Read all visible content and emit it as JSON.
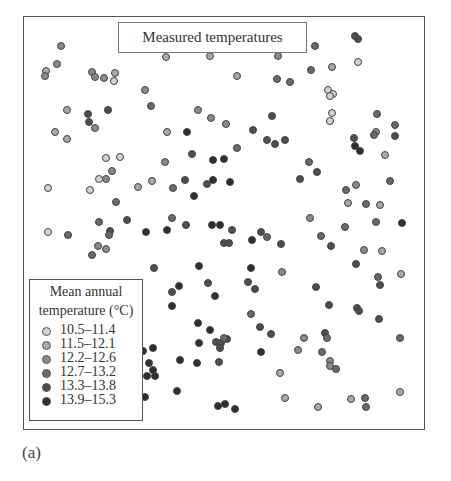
{
  "title": "Measured temperatures",
  "panel_label": "(a)",
  "legend": {
    "title_line1": "Mean annual",
    "title_line2": "temperature (°C)",
    "items": [
      {
        "label": "10.5–11.4",
        "color": "#d2d2d2"
      },
      {
        "label": "11.5–12.1",
        "color": "#a8a8a8"
      },
      {
        "label": "12.2–12.6",
        "color": "#8a8a8a"
      },
      {
        "label": "12.7–13.2",
        "color": "#6a6a6a"
      },
      {
        "label": "13.3–13.8",
        "color": "#4e4e4e"
      },
      {
        "label": "13.9–15.3",
        "color": "#2e2e2e"
      }
    ]
  },
  "chart_data": {
    "type": "scatter",
    "title": "Measured temperatures",
    "xlabel": "",
    "ylabel": "",
    "legend_position": "bottom-left",
    "grid": false,
    "class_labels": [
      "10.5–11.4",
      "11.5–12.1",
      "12.2–12.6",
      "12.7–13.2",
      "13.3–13.8",
      "13.9–15.3"
    ],
    "points_px": [
      [
        61,
        46,
        3
      ],
      [
        57,
        64,
        3
      ],
      [
        46,
        71,
        2
      ],
      [
        45,
        76,
        3
      ],
      [
        92,
        72,
        3
      ],
      [
        95,
        77,
        3
      ],
      [
        104,
        78,
        3
      ],
      [
        115,
        73,
        2
      ],
      [
        114,
        81,
        1
      ],
      [
        166,
        57,
        2
      ],
      [
        210,
        56,
        2
      ],
      [
        278,
        56,
        3
      ],
      [
        315,
        46,
        4
      ],
      [
        311,
        70,
        4
      ],
      [
        332,
        67,
        2
      ],
      [
        358,
        39,
        5
      ],
      [
        355,
        36,
        5
      ],
      [
        358,
        62,
        1
      ],
      [
        237,
        76,
        2
      ],
      [
        277,
        79,
        4
      ],
      [
        290,
        82,
        4
      ],
      [
        145,
        90,
        3
      ],
      [
        151,
        106,
        4
      ],
      [
        67,
        110,
        2
      ],
      [
        88,
        114,
        5
      ],
      [
        89,
        122,
        5
      ],
      [
        95,
        128,
        3
      ],
      [
        108,
        110,
        5
      ],
      [
        55,
        132,
        2
      ],
      [
        67,
        139,
        2
      ],
      [
        198,
        110,
        3
      ],
      [
        211,
        118,
        3
      ],
      [
        226,
        124,
        3
      ],
      [
        272,
        116,
        5
      ],
      [
        253,
        130,
        5
      ],
      [
        167,
        132,
        2
      ],
      [
        187,
        132,
        6
      ],
      [
        328,
        90,
        1
      ],
      [
        333,
        94,
        1
      ],
      [
        330,
        96,
        1
      ],
      [
        332,
        113,
        1
      ],
      [
        330,
        121,
        1
      ],
      [
        377,
        114,
        4
      ],
      [
        395,
        125,
        4
      ],
      [
        376,
        132,
        3
      ],
      [
        374,
        135,
        4
      ],
      [
        395,
        136,
        5
      ],
      [
        267,
        140,
        5
      ],
      [
        275,
        144,
        5
      ],
      [
        285,
        140,
        5
      ],
      [
        237,
        148,
        4
      ],
      [
        192,
        154,
        5
      ],
      [
        213,
        160,
        6
      ],
      [
        224,
        159,
        6
      ],
      [
        165,
        162,
        3
      ],
      [
        106,
        158,
        1
      ],
      [
        120,
        157,
        1
      ],
      [
        354,
        138,
        5
      ],
      [
        355,
        146,
        6
      ],
      [
        360,
        151,
        6
      ],
      [
        385,
        155,
        2
      ],
      [
        309,
        162,
        4
      ],
      [
        317,
        172,
        5
      ],
      [
        300,
        179,
        5
      ],
      [
        112,
        171,
        3
      ],
      [
        99,
        179,
        1
      ],
      [
        106,
        179,
        3
      ],
      [
        48,
        188,
        1
      ],
      [
        90,
        190,
        1
      ],
      [
        138,
        187,
        2
      ],
      [
        152,
        181,
        2
      ],
      [
        173,
        188,
        4
      ],
      [
        185,
        180,
        5
      ],
      [
        207,
        184,
        5
      ],
      [
        213,
        180,
        6
      ],
      [
        230,
        182,
        6
      ],
      [
        194,
        196,
        6
      ],
      [
        346,
        190,
        4
      ],
      [
        356,
        185,
        3
      ],
      [
        390,
        181,
        4
      ],
      [
        116,
        202,
        4
      ],
      [
        348,
        203,
        2
      ],
      [
        366,
        204,
        4
      ],
      [
        380,
        205,
        2
      ],
      [
        99,
        222,
        4
      ],
      [
        127,
        220,
        5
      ],
      [
        172,
        218,
        4
      ],
      [
        186,
        225,
        5
      ],
      [
        212,
        225,
        6
      ],
      [
        220,
        225,
        6
      ],
      [
        232,
        230,
        5
      ],
      [
        167,
        230,
        6
      ],
      [
        146,
        232,
        6
      ],
      [
        110,
        231,
        5
      ],
      [
        109,
        235,
        4
      ],
      [
        48,
        232,
        1
      ],
      [
        68,
        235,
        4
      ],
      [
        98,
        246,
        3
      ],
      [
        106,
        249,
        3
      ],
      [
        92,
        255,
        4
      ],
      [
        310,
        218,
        3
      ],
      [
        321,
        236,
        4
      ],
      [
        331,
        246,
        5
      ],
      [
        345,
        227,
        4
      ],
      [
        376,
        222,
        4
      ],
      [
        402,
        223,
        6
      ],
      [
        252,
        240,
        6
      ],
      [
        261,
        232,
        5
      ],
      [
        267,
        237,
        4
      ],
      [
        281,
        244,
        5
      ],
      [
        224,
        243,
        5
      ],
      [
        229,
        243,
        5
      ],
      [
        364,
        250,
        3
      ],
      [
        382,
        251,
        2
      ],
      [
        356,
        264,
        5
      ],
      [
        401,
        274,
        2
      ],
      [
        154,
        268,
        5
      ],
      [
        199,
        266,
        6
      ],
      [
        251,
        268,
        6
      ],
      [
        282,
        272,
        3
      ],
      [
        208,
        283,
        5
      ],
      [
        179,
        286,
        6
      ],
      [
        172,
        292,
        5
      ],
      [
        172,
        306,
        6
      ],
      [
        215,
        296,
        6
      ],
      [
        248,
        282,
        5
      ],
      [
        255,
        289,
        5
      ],
      [
        316,
        287,
        5
      ],
      [
        378,
        277,
        4
      ],
      [
        380,
        285,
        5
      ],
      [
        329,
        305,
        5
      ],
      [
        357,
        308,
        5
      ],
      [
        359,
        311,
        5
      ],
      [
        251,
        314,
        4
      ],
      [
        379,
        319,
        5
      ],
      [
        198,
        323,
        6
      ],
      [
        210,
        330,
        6
      ],
      [
        260,
        327,
        5
      ],
      [
        271,
        334,
        5
      ],
      [
        199,
        343,
        6
      ],
      [
        216,
        342,
        5
      ],
      [
        221,
        343,
        5
      ],
      [
        227,
        339,
        5
      ],
      [
        224,
        338,
        4
      ],
      [
        220,
        348,
        5
      ],
      [
        261,
        352,
        6
      ],
      [
        304,
        338,
        3
      ],
      [
        325,
        333,
        5
      ],
      [
        327,
        338,
        4
      ],
      [
        298,
        350,
        3
      ],
      [
        322,
        352,
        4
      ],
      [
        330,
        361,
        3
      ],
      [
        330,
        366,
        3
      ],
      [
        336,
        369,
        4
      ],
      [
        400,
        338,
        4
      ],
      [
        153,
        348,
        6
      ],
      [
        143,
        351,
        6
      ],
      [
        149,
        363,
        6
      ],
      [
        153,
        370,
        6
      ],
      [
        155,
        376,
        6
      ],
      [
        147,
        376,
        6
      ],
      [
        180,
        360,
        6
      ],
      [
        197,
        363,
        6
      ],
      [
        219,
        362,
        5
      ],
      [
        280,
        373,
        2
      ],
      [
        177,
        391,
        6
      ],
      [
        145,
        397,
        6
      ],
      [
        218,
        406,
        6
      ],
      [
        225,
        404,
        6
      ],
      [
        235,
        409,
        6
      ],
      [
        285,
        398,
        2
      ],
      [
        318,
        407,
        2
      ],
      [
        351,
        399,
        2
      ],
      [
        365,
        398,
        4
      ],
      [
        366,
        407,
        4
      ],
      [
        400,
        392,
        2
      ]
    ]
  }
}
